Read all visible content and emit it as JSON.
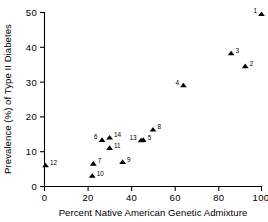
{
  "chart_data": {
    "type": "scatter",
    "title": "",
    "xlabel": "Percent Native American Genetic Admixture",
    "ylabel": "Prevalence (%) of Type II Diabetes",
    "xlim": [
      0,
      100
    ],
    "ylim": [
      0,
      50
    ],
    "xticks": [
      0,
      20,
      40,
      60,
      80,
      100
    ],
    "yticks": [
      0,
      10,
      20,
      30,
      40,
      50
    ],
    "xticklabels": [
      "0",
      "20",
      "40",
      "60",
      "80",
      "100"
    ],
    "yticklabels": [
      "0",
      "10",
      "20",
      "30",
      "40",
      "50"
    ],
    "grid": false,
    "legend": false,
    "marker": "triangle",
    "marker_color": "#000000",
    "points": [
      {
        "label": "1",
        "x": 100.0,
        "y": 49.5,
        "label_pos": "left"
      },
      {
        "label": "2",
        "x": 92.5,
        "y": 34.5,
        "label_pos": "right"
      },
      {
        "label": "3",
        "x": 86.0,
        "y": 38.2,
        "label_pos": "right"
      },
      {
        "label": "4",
        "x": 64.0,
        "y": 29.0,
        "label_pos": "left"
      },
      {
        "label": "5",
        "x": 45.5,
        "y": 13.3,
        "label_pos": "right"
      },
      {
        "label": "6",
        "x": 26.5,
        "y": 13.3,
        "label_pos": "left"
      },
      {
        "label": "7",
        "x": 22.5,
        "y": 6.5,
        "label_pos": "right"
      },
      {
        "label": "8",
        "x": 50.0,
        "y": 16.3,
        "label_pos": "right"
      },
      {
        "label": "9",
        "x": 36.0,
        "y": 7.0,
        "label_pos": "right"
      },
      {
        "label": "10",
        "x": 22.0,
        "y": 3.0,
        "label_pos": "right"
      },
      {
        "label": "11",
        "x": 30.0,
        "y": 11.0,
        "label_pos": "right"
      },
      {
        "label": "12",
        "x": 0.5,
        "y": 6.0,
        "label_pos": "right"
      },
      {
        "label": "13",
        "x": 44.5,
        "y": 13.2,
        "label_pos": "left"
      },
      {
        "label": "14",
        "x": 30.0,
        "y": 14.0,
        "label_pos": "right"
      }
    ]
  },
  "axes": {
    "x_title": "Percent Native American Genetic Admixture",
    "y_title": "Prevalence (%) of Type II Diabetes"
  },
  "top_fragment": ""
}
